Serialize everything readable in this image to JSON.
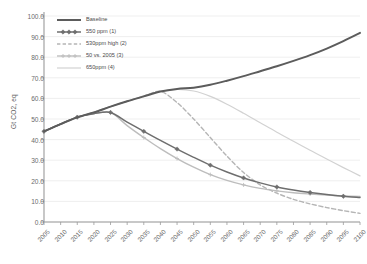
{
  "chart_data": {
    "type": "line",
    "title": "",
    "xlabel": "",
    "ylabel": "Gt CO2, eq",
    "ylim": [
      0,
      100
    ],
    "ytick_step": 10,
    "grid": true,
    "legend_position": "top-left",
    "x": [
      2005,
      2010,
      2015,
      2020,
      2025,
      2030,
      2035,
      2040,
      2045,
      2050,
      2055,
      2060,
      2065,
      2070,
      2075,
      2080,
      2085,
      2090,
      2095,
      2100
    ],
    "categories": [
      "2005",
      "2010",
      "2015",
      "2020",
      "2025",
      "2030",
      "2035",
      "2040",
      "2045",
      "2050",
      "2055",
      "2060",
      "2065",
      "2070",
      "2075",
      "2080",
      "2085",
      "2090",
      "2095",
      "2100"
    ],
    "yticks": [
      "0.0",
      "10.0",
      "20.0",
      "30.0",
      "40.0",
      "50.0",
      "60.0",
      "70.0",
      "80.0",
      "90.0",
      "100.0"
    ],
    "series": [
      {
        "name": "Baseline",
        "color": "#5c5c5c",
        "style": "solid",
        "width": 2.0,
        "marker": "none",
        "values": [
          44.0,
          47.5,
          50.8,
          53.2,
          56.0,
          58.6,
          61.0,
          63.3,
          64.6,
          65.2,
          66.6,
          68.6,
          70.8,
          73.2,
          75.6,
          78.2,
          81.0,
          84.2,
          87.8,
          91.8
        ]
      },
      {
        "name": "550 ppm (1)",
        "color": "#6e6e6e",
        "style": "solid",
        "width": 1.5,
        "marker": "diamond",
        "values": [
          44.0,
          47.6,
          50.9,
          52.6,
          53.2,
          48.5,
          44.0,
          39.6,
          35.4,
          31.4,
          27.6,
          24.3,
          21.4,
          19.0,
          17.0,
          15.5,
          14.3,
          13.3,
          12.5,
          11.9
        ]
      },
      {
        "name": "530ppm high (2)",
        "color": "#b5b5b5",
        "style": "dashed",
        "width": 1.4,
        "marker": "none",
        "values": [
          44.0,
          47.5,
          50.8,
          53.2,
          56.0,
          58.6,
          61.0,
          63.4,
          58.0,
          50.0,
          41.0,
          32.0,
          24.0,
          18.0,
          14.0,
          11.0,
          8.8,
          7.0,
          5.5,
          4.2
        ]
      },
      {
        "name": "50 vs. 2005 (3)",
        "color": "#bdbdbd",
        "style": "solid",
        "width": 1.4,
        "marker": "cross",
        "values": [
          44.0,
          47.6,
          50.9,
          52.6,
          53.2,
          46.8,
          41.0,
          35.6,
          30.8,
          26.6,
          23.0,
          20.2,
          18.0,
          16.3,
          15.1,
          14.2,
          13.6,
          13.1,
          12.7,
          12.4
        ]
      },
      {
        "name": "650ppm (4)",
        "color": "#d2d2d2",
        "style": "solid",
        "width": 1.2,
        "marker": "none",
        "values": [
          44.0,
          47.5,
          50.8,
          53.2,
          56.0,
          58.6,
          61.2,
          63.4,
          64.4,
          63.6,
          61.0,
          57.2,
          52.8,
          48.2,
          43.6,
          39.2,
          34.8,
          30.6,
          26.4,
          22.4
        ]
      }
    ]
  },
  "axes": {
    "x_axis_color": "#9a9a9a",
    "y_axis_color": "#9a9a9a",
    "grid_color": "#e8e8e8"
  }
}
